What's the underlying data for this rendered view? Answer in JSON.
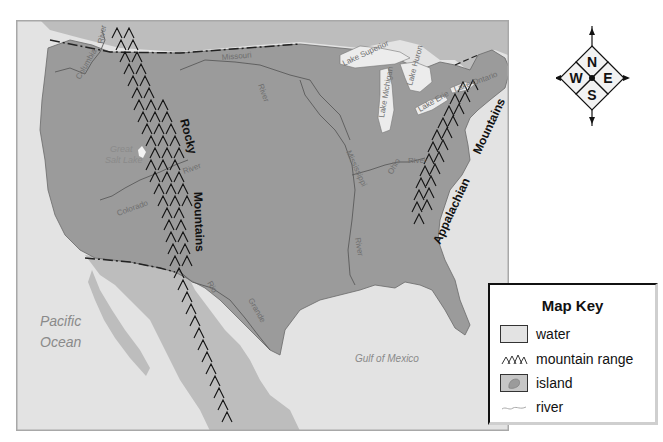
{
  "map": {
    "colors": {
      "water": "#e3e3e3",
      "usa_land": "#9b9b9b",
      "neighbor_land": "#bdbdbd",
      "lake": "#ececec",
      "river": "#5a5a5a",
      "mountain": "#111111",
      "frame": "#a8a8a8"
    },
    "oceans": [
      {
        "name": "pacific",
        "lines": [
          "Pacific",
          "Ocean"
        ]
      },
      {
        "name": "atlantic",
        "lines": [
          "Atlantic",
          "Ocean"
        ]
      },
      {
        "name": "gulf",
        "lines": [
          "Gulf  of  Mexico"
        ]
      }
    ],
    "lake_labels": {
      "great_salt_lake": [
        "Great",
        "Salt Lake"
      ],
      "superior": "Lake Superior",
      "michigan": "Lake Michigan",
      "huron": "Lake Huron",
      "erie": "Lake Erie",
      "ontario": "Lake Ontario"
    },
    "rivers": {
      "columbia": "Columbia",
      "columbia_river_word": "River",
      "missouri": "Missouri",
      "missouri_river_word": "River",
      "mississippi": "Mississippi",
      "mississippi_river_word": "River",
      "ohio": "Ohio",
      "ohio_river_word": "River",
      "colorado": "Colorado",
      "colorado_river_word": "River",
      "rio": "Rio",
      "grande": "Grande"
    },
    "mountains": {
      "rocky_1": "Rocky",
      "rocky_2": "Mountains",
      "appalachian_1": "Appalachian",
      "appalachian_2": "Mountains"
    }
  },
  "compass": {
    "north": "N",
    "south": "S",
    "east": "E",
    "west": "W"
  },
  "legend": {
    "title": "Map Key",
    "items": [
      {
        "icon": "water-swatch",
        "label": "water"
      },
      {
        "icon": "mountain-range-icon",
        "label": "mountain range"
      },
      {
        "icon": "island-swatch",
        "label": "island"
      },
      {
        "icon": "river-icon",
        "label": "river"
      }
    ]
  }
}
